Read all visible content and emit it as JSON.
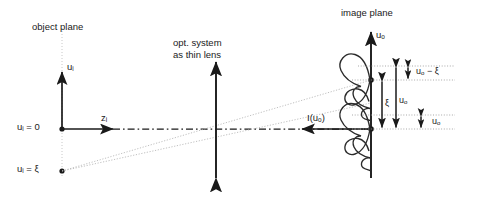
{
  "figure": {
    "type": "optical-imaging-schematic",
    "width": 483,
    "height": 197,
    "background": "#ffffff",
    "ink": "#1a1a1a",
    "faint_ink": "#b3b3b3"
  },
  "titles": {
    "object_plane": "object plane",
    "optical_system_line1": "opt. system",
    "optical_system_line2": "as thin lens",
    "image_plane": "image plane"
  },
  "object_plane": {
    "vertical_axis_label_base": "u",
    "vertical_axis_label_sub": "i",
    "horizontal_axis_label_base": "z",
    "horizontal_axis_label_sub": "i",
    "origin_label_base": "u",
    "origin_label_sub": "i",
    "origin_label_rest": " = 0",
    "source_label_base": "u",
    "source_label_sub": "i",
    "source_label_rest": " = ξ"
  },
  "image_plane": {
    "vertical_axis_label_base": "u",
    "vertical_axis_label_sub": "o",
    "intensity_label": "I(u",
    "intensity_label_sub": "o",
    "intensity_label_close": ")",
    "measure_top_base": "u",
    "measure_top_sub": "o",
    "measure_top_rest": " − ξ",
    "measure_xi": "ξ",
    "measure_uo_inner_base": "u",
    "measure_uo_inner_sub": "o",
    "measure_uo_outer_base": "u",
    "measure_uo_outer_sub": "o"
  }
}
